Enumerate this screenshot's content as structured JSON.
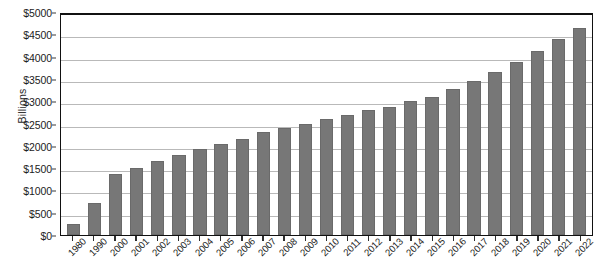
{
  "chart_data": {
    "type": "bar",
    "title": "",
    "xlabel": "",
    "ylabel": "Billions",
    "ylim": [
      0,
      5000
    ],
    "ytick_labels": [
      "$5000",
      "$4500",
      "$4000",
      "$3500",
      "$3000",
      "$2500",
      "$2000",
      "$1500",
      "$1000",
      "$500",
      "$0"
    ],
    "ytick_values": [
      5000,
      4500,
      4000,
      3500,
      3000,
      2500,
      2000,
      1500,
      1000,
      500,
      0
    ],
    "grid": true,
    "legend": false,
    "bar_color": "#777777",
    "categories": [
      "1980",
      "1990",
      "2000",
      "2001",
      "2002",
      "2003",
      "2004",
      "2005",
      "2006",
      "2007",
      "2008",
      "2009",
      "2010",
      "2011",
      "2012",
      "2013",
      "2014",
      "2015",
      "2016",
      "2017",
      "2018",
      "2019",
      "2020",
      "2021",
      "2022"
    ],
    "values": [
      250,
      720,
      1370,
      1500,
      1660,
      1790,
      1920,
      2030,
      2160,
      2300,
      2410,
      2500,
      2600,
      2690,
      2800,
      2880,
      3000,
      3100,
      3280,
      3450,
      3660,
      3880,
      4130,
      4400,
      4650
    ]
  }
}
